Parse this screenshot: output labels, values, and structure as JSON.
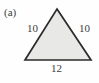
{
  "figure": {
    "panel_label": "(a)",
    "shape": "triangle",
    "background_color": "#fefefe",
    "fill_color": "#e8e8e6",
    "stroke_color": "#2b2b2b",
    "text_color": "#3d3d3d",
    "vertices": {
      "apex": [
        57,
        9
      ],
      "base_left": [
        25,
        60
      ],
      "base_right": [
        91,
        60
      ]
    },
    "labels": {
      "left_side": "10",
      "right_side": "10",
      "base": "12"
    }
  },
  "chart_data": {
    "type": "diagram",
    "title": "(a)",
    "shape": "isosceles triangle",
    "edges": [
      {
        "name": "left side",
        "label": "10",
        "value": 10
      },
      {
        "name": "right side",
        "label": "10",
        "value": 10
      },
      {
        "name": "base",
        "label": "12",
        "value": 12
      }
    ],
    "annotations": [
      "(a)",
      "10",
      "10",
      "12"
    ]
  }
}
